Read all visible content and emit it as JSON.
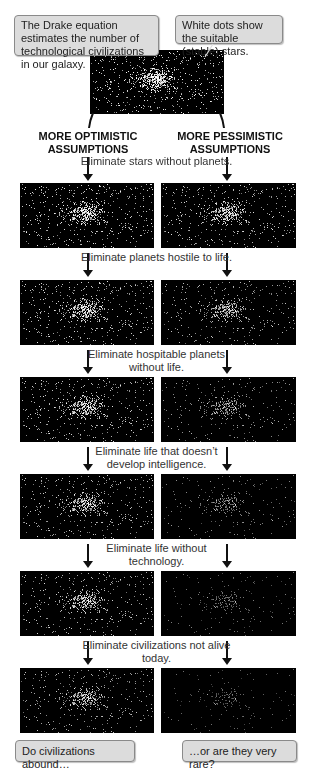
{
  "callouts": {
    "top_left": "The Drake equation estimates the number of technological civilizations in our galaxy.",
    "top_right": "White dots show the suitable (stable) stars.",
    "bottom_left": "Do civilizations abound…",
    "bottom_right": "…or are they very rare?"
  },
  "columns": {
    "left_heading": "MORE OPTIMISTIC ASSUMPTIONS",
    "right_heading": "MORE PESSIMISTIC ASSUMPTIONS"
  },
  "steps": [
    "Eliminate stars without planets.",
    "Eliminate planets hostile to life.",
    "Eliminate hospitable planets without life.",
    "Eliminate life that doesn’t develop intelligence.",
    "Eliminate life without technology.",
    "Eliminate civilizations not alive today."
  ],
  "star_fields": {
    "top": {
      "density": 1.0,
      "brightness": 1.0
    },
    "optimistic": [
      {
        "density": 0.85,
        "brightness": 0.95
      },
      {
        "density": 0.8,
        "brightness": 0.9
      },
      {
        "density": 0.75,
        "brightness": 0.9
      },
      {
        "density": 0.7,
        "brightness": 0.85
      },
      {
        "density": 0.66,
        "brightness": 0.85
      },
      {
        "density": 0.62,
        "brightness": 0.8
      }
    ],
    "pessimistic": [
      {
        "density": 0.75,
        "brightness": 0.9
      },
      {
        "density": 0.6,
        "brightness": 0.8
      },
      {
        "density": 0.45,
        "brightness": 0.7
      },
      {
        "density": 0.35,
        "brightness": 0.6
      },
      {
        "density": 0.28,
        "brightness": 0.5
      },
      {
        "density": 0.22,
        "brightness": 0.45
      }
    ]
  },
  "colors": {
    "callout_fill": "#dcdcdc",
    "field_bg": "#000000",
    "star": "#ffffff"
  }
}
